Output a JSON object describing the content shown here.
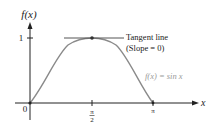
{
  "diagram": {
    "y_axis_label": "f(x)",
    "x_axis_label": "x",
    "y_tick_label": "1",
    "origin_label": "0",
    "x_tick_half_pi": {
      "num": "π",
      "den": "2"
    },
    "x_tick_pi": "π",
    "tangent_label_line1": "Tangent line",
    "tangent_label_line2": "(Slope = 0)",
    "curve_label": "f(x) = sin x",
    "colors": {
      "axis": "#222222",
      "curve": "#8a8a8a",
      "tangent": "#555555",
      "curve_label": "#9a9a9a",
      "text": "#222222"
    }
  }
}
